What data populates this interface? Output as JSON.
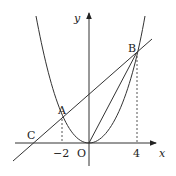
{
  "diagram": {
    "type": "coordinate-geometry",
    "axes": {
      "x_label": "x",
      "y_label": "y",
      "origin_label": "O"
    },
    "points": {
      "A": {
        "label": "A",
        "x": -2
      },
      "B": {
        "label": "B",
        "x": 4
      },
      "C": {
        "label": "C"
      },
      "O": {
        "label": "O"
      }
    },
    "tick_labels": [
      "−2",
      "4"
    ],
    "colors": {
      "stroke": "#333333",
      "dashed": "#555555",
      "background": "#ffffff"
    }
  },
  "labels": {
    "x": "x",
    "y": "y",
    "O": "O",
    "A": "A",
    "B": "B",
    "C": "C",
    "tick_neg2": "−2",
    "tick_4": "4"
  }
}
